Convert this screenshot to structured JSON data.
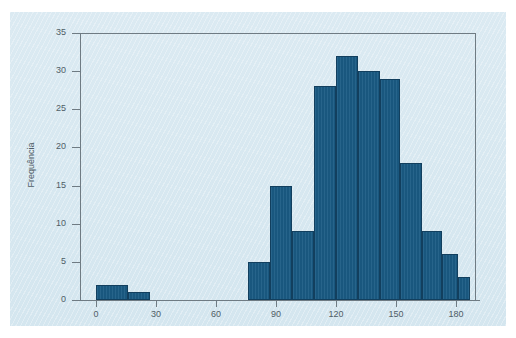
{
  "figure": {
    "background_color": "#d8e9f1",
    "plot_background_color": "#dcebf2",
    "bar_color": "#1a5b84",
    "bar_edge_color": "#123f5e",
    "axis_color": "#6f7b83",
    "text_color": "#4f5d66"
  },
  "chart_data": {
    "type": "bar",
    "title": "",
    "subtitle": "",
    "xlabel": "",
    "ylabel": "Frequência",
    "xlim": [
      -8,
      190
    ],
    "ylim": [
      0,
      35
    ],
    "grid": false,
    "legend": null,
    "bin_width": 11,
    "xticks": [
      0,
      30,
      60,
      90,
      120,
      150,
      180
    ],
    "xtick_labels": [
      "0",
      "30",
      "60",
      "90",
      "120",
      "150",
      "180"
    ],
    "yticks": [
      0,
      5,
      10,
      15,
      20,
      25,
      30,
      35
    ],
    "ytick_labels": [
      "0",
      "5",
      "10",
      "15",
      "20",
      "25",
      "30",
      "35"
    ],
    "bins": [
      {
        "left": 0,
        "right": 16,
        "value": 2
      },
      {
        "left": 16,
        "right": 27,
        "value": 1
      },
      {
        "left": 76,
        "right": 87,
        "value": 5
      },
      {
        "left": 87,
        "right": 98,
        "value": 15
      },
      {
        "left": 98,
        "right": 109,
        "value": 9
      },
      {
        "left": 109,
        "right": 120,
        "value": 28
      },
      {
        "left": 120,
        "right": 131,
        "value": 32
      },
      {
        "left": 131,
        "right": 142,
        "value": 30
      },
      {
        "left": 142,
        "right": 152,
        "value": 29
      },
      {
        "left": 152,
        "right": 163,
        "value": 18
      },
      {
        "left": 163,
        "right": 173,
        "value": 9
      },
      {
        "left": 173,
        "right": 181,
        "value": 6
      },
      {
        "left": 181,
        "right": 187,
        "value": 3
      }
    ],
    "categories": [
      "0-16",
      "16-27",
      "76-87",
      "87-98",
      "98-109",
      "109-120",
      "120-131",
      "131-142",
      "142-152",
      "152-163",
      "163-173",
      "173-181",
      "181-187"
    ],
    "values": [
      2,
      1,
      5,
      15,
      9,
      28,
      32,
      30,
      29,
      18,
      9,
      6,
      3
    ]
  }
}
